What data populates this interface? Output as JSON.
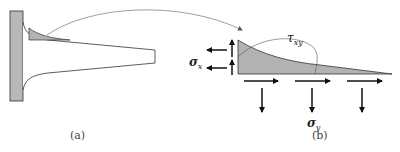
{
  "figure": {
    "panel_a": {
      "caption": "(a)"
    },
    "panel_b": {
      "caption": "(b)",
      "labels": {
        "tau": {
          "symbol": "τ",
          "subscript": "xy"
        },
        "sigma_x": {
          "symbol": "σ",
          "subscript": "x"
        },
        "sigma_y": {
          "symbol": "σ",
          "subscript": "y"
        }
      }
    }
  },
  "colors": {
    "fill": "#b3b3b3",
    "stroke": "#333333",
    "wall_fill": "#b8b8b8",
    "arc": "#888888"
  }
}
